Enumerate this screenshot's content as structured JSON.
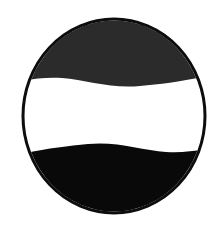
{
  "canvas": {
    "width": 221,
    "height": 226,
    "background_color": "#ffffff"
  },
  "artwork": {
    "name": "circular-wave-emblem",
    "type": "monochrome-logo-mark",
    "description": "Circle outlined in black containing a dark charcoal wave form at the top, a white horizontal band through the middle, and a solid black wave form at the bottom",
    "symmetry": "180-degree rotational",
    "circle": {
      "center_x": 114,
      "center_y": 116,
      "radius_x": 91,
      "radius_y": 97,
      "stroke_color": "#0d0d0d",
      "stroke_width": 3,
      "fill_color": "#ffffff"
    },
    "top_wave": {
      "name": "top-wave-shape",
      "fill_color": "#2b2b2b",
      "inner_inset": 4,
      "left_tip_x": 31,
      "left_tip_y": 80,
      "right_tip_x": 193,
      "right_tip_y": 82,
      "crest_y": 24
    },
    "middle_band": {
      "name": "middle-white-band",
      "fill_color": "#ffffff",
      "top_y": 80,
      "bottom_y": 150
    },
    "bottom_wave": {
      "name": "bottom-wave-shape",
      "fill_color": "#090909",
      "inner_inset": 4,
      "left_tip_x": 31,
      "left_tip_y": 150,
      "right_tip_x": 195,
      "right_tip_y": 146,
      "trough_y": 208
    }
  },
  "colors": {
    "outline_black": "#0d0d0d",
    "top_charcoal": "#2b2b2b",
    "bottom_black": "#090909",
    "field_white": "#ffffff"
  }
}
